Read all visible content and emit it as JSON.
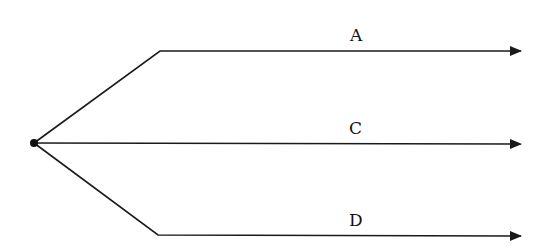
{
  "diagram": {
    "type": "branching-paths",
    "origin": {
      "x": 34,
      "y": 143,
      "shape": "dot"
    },
    "colors": {
      "line": "#1a1a1a",
      "background": "#ffffff"
    },
    "paths": [
      {
        "label": "A",
        "points": [
          [
            34,
            143
          ],
          [
            160,
            51
          ],
          [
            521,
            51
          ]
        ],
        "label_pos": [
          356,
          41
        ]
      },
      {
        "label": "C",
        "points": [
          [
            34,
            143
          ],
          [
            521,
            144
          ]
        ],
        "label_pos": [
          355,
          134
        ]
      },
      {
        "label": "D",
        "points": [
          [
            34,
            143
          ],
          [
            158,
            235
          ],
          [
            521,
            236
          ]
        ],
        "label_pos": [
          355,
          226
        ]
      }
    ]
  }
}
